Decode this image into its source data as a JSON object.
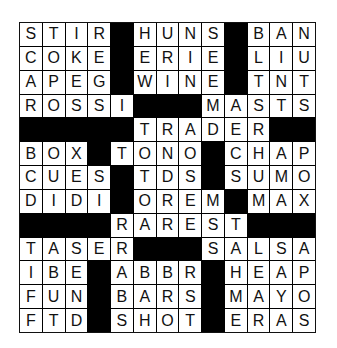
{
  "puzzle": {
    "type": "crossword",
    "rows": 13,
    "cols": 13,
    "block_color": "#000000",
    "cell_color": "#ffffff",
    "grid": [
      "STIR#HUNS#BAN",
      "COKE#ERIE#LIU",
      "APEG#WINE#TNT",
      "ROSSI###MASTS",
      "#####TRADER###",
      "BOX#TONO#CHAP",
      "CUES#TDS#SUMO",
      "DIDI#OREM#MAX",
      "####RAREST####",
      "TASER###SALSA",
      "IBE#ABBR#HEAP",
      "FUN#BARS#MAYO",
      "FTD#SHOT#ERAS"
    ],
    "across_words": [
      "STIR",
      "HUNS",
      "BAN",
      "COKE",
      "ERIE",
      "LIU",
      "APEG",
      "WINE",
      "TNT",
      "ROSSI",
      "MASTS",
      "TRADER",
      "BOX",
      "TONO",
      "CHAP",
      "CUES",
      "TDS",
      "SUMO",
      "DIDI",
      "OREM",
      "MAX",
      "RAREST",
      "TASER",
      "SALSA",
      "IBE",
      "ABBR",
      "HEAP",
      "FUN",
      "BARS",
      "MAYO",
      "FTD",
      "SHOT",
      "ERAS"
    ]
  }
}
